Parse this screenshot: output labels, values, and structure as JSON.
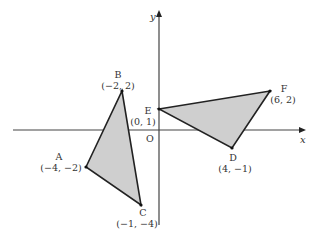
{
  "diagram": {
    "axes": {
      "x_label": "x",
      "y_label": "y",
      "origin_label": "O"
    },
    "colors": {
      "fill": "#cfcfcf",
      "stroke": "#222222",
      "axis": "#444444"
    },
    "triangles": [
      {
        "name": "ABC",
        "vertices": [
          {
            "name": "A",
            "coord": "(−4, −2)",
            "x": -4,
            "y": -2
          },
          {
            "name": "B",
            "coord": "(−2, 2)",
            "x": -2,
            "y": 2
          },
          {
            "name": "C",
            "coord": "(−1, −4)",
            "x": -1,
            "y": -4
          }
        ]
      },
      {
        "name": "DEF",
        "vertices": [
          {
            "name": "D",
            "coord": "(4, −1)",
            "x": 4,
            "y": -1
          },
          {
            "name": "E",
            "coord": "(0, 1)",
            "x": 0,
            "y": 1
          },
          {
            "name": "F",
            "coord": "(6, 2)",
            "x": 6,
            "y": 2
          }
        ]
      }
    ],
    "points": {
      "A": {
        "name": "A",
        "coord": "(−4, −2)"
      },
      "B": {
        "name": "B",
        "coord": "(−2, 2)"
      },
      "C": {
        "name": "C",
        "coord": "(−1, −4)"
      },
      "D": {
        "name": "D",
        "coord": "(4, −1)"
      },
      "E": {
        "name": "E",
        "coord": "(0, 1)"
      },
      "F": {
        "name": "F",
        "coord": "(6, 2)"
      }
    }
  }
}
